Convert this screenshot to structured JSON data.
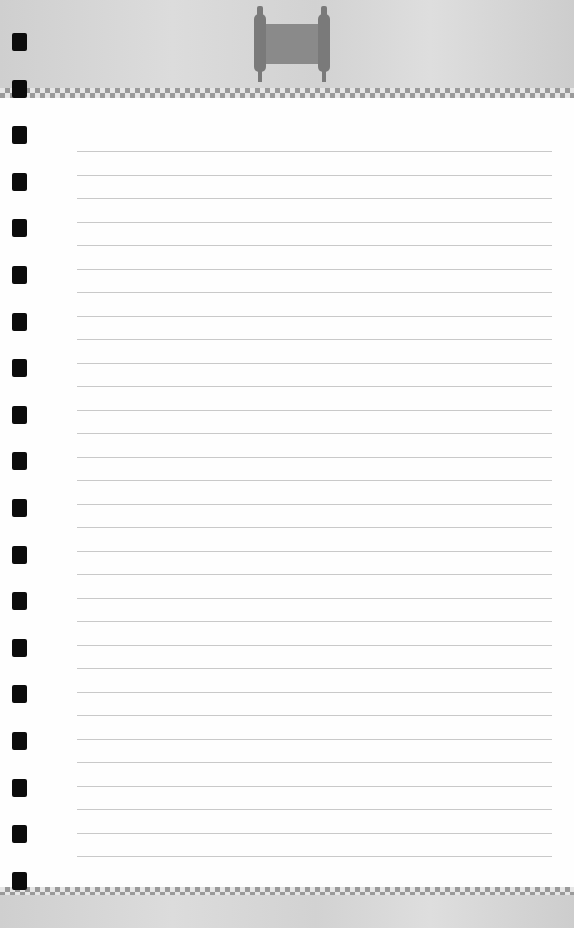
{
  "page": {
    "type": "lined notebook page",
    "colors": {
      "header_band": "#d6d6d6",
      "checker": "#9a9a9a",
      "paper": "#fefefe",
      "rule_line": "#c9c9c9",
      "hole": "#0c0c0c",
      "scroll_icon": "#888888"
    },
    "header_icon": "scroll-icon",
    "rule_lines": {
      "count": 31,
      "first_y": 151,
      "spacing": 23.5,
      "left": 77,
      "right": 552
    },
    "binding_holes": {
      "count": 19,
      "first_y": 33,
      "spacing": 46.6
    }
  }
}
